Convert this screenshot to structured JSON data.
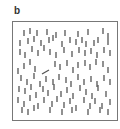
{
  "panel": {
    "label": "b",
    "description": "Visual search stimulus: array of vertical line distractors with a single oblique target",
    "frame_color": "#777777",
    "line_color": "#555555"
  },
  "stimulus": {
    "distractor_orientation": "vertical",
    "target_orientation": "oblique",
    "target": {
      "x1": 42,
      "y1": 74,
      "x2": 49,
      "y2": 70
    },
    "distractors": [
      [
        24,
        33
      ],
      [
        30,
        31
      ],
      [
        37,
        33
      ],
      [
        47,
        32
      ],
      [
        56,
        35
      ],
      [
        65,
        33
      ],
      [
        78,
        34
      ],
      [
        88,
        32
      ],
      [
        103,
        31
      ],
      [
        108,
        36
      ],
      [
        20,
        43
      ],
      [
        28,
        41
      ],
      [
        34,
        39
      ],
      [
        41,
        43
      ],
      [
        49,
        40
      ],
      [
        53,
        38
      ],
      [
        62,
        44
      ],
      [
        70,
        40
      ],
      [
        76,
        42
      ],
      [
        82,
        40
      ],
      [
        86,
        44
      ],
      [
        94,
        43
      ],
      [
        98,
        40
      ],
      [
        108,
        42
      ],
      [
        20,
        52
      ],
      [
        25,
        55
      ],
      [
        32,
        49
      ],
      [
        38,
        53
      ],
      [
        44,
        48
      ],
      [
        50,
        52
      ],
      [
        56,
        55
      ],
      [
        64,
        50
      ],
      [
        72,
        54
      ],
      [
        79,
        50
      ],
      [
        85,
        53
      ],
      [
        91,
        51
      ],
      [
        97,
        55
      ],
      [
        104,
        50
      ],
      [
        110,
        53
      ],
      [
        18,
        71
      ],
      [
        24,
        66
      ],
      [
        30,
        62
      ],
      [
        35,
        69
      ],
      [
        55,
        64
      ],
      [
        60,
        67
      ],
      [
        67,
        63
      ],
      [
        73,
        70
      ],
      [
        78,
        65
      ],
      [
        85,
        63
      ],
      [
        90,
        67
      ],
      [
        96,
        62
      ],
      [
        103,
        64
      ],
      [
        108,
        70
      ],
      [
        21,
        78
      ],
      [
        27,
        82
      ],
      [
        34,
        76
      ],
      [
        40,
        84
      ],
      [
        46,
        79
      ],
      [
        53,
        82
      ],
      [
        59,
        77
      ],
      [
        66,
        80
      ],
      [
        71,
        84
      ],
      [
        78,
        77
      ],
      [
        84,
        82
      ],
      [
        91,
        79
      ],
      [
        97,
        84
      ],
      [
        104,
        78
      ],
      [
        110,
        82
      ],
      [
        19,
        89
      ],
      [
        25,
        91
      ],
      [
        31,
        87
      ],
      [
        36,
        95
      ],
      [
        43,
        89
      ],
      [
        48,
        93
      ],
      [
        54,
        87
      ],
      [
        61,
        94
      ],
      [
        67,
        90
      ],
      [
        73,
        96
      ],
      [
        80,
        88
      ],
      [
        86,
        92
      ],
      [
        92,
        96
      ],
      [
        98,
        88
      ],
      [
        106,
        94
      ],
      [
        18,
        100
      ],
      [
        24,
        104
      ],
      [
        30,
        98
      ],
      [
        38,
        106
      ],
      [
        44,
        100
      ],
      [
        52,
        104
      ],
      [
        57,
        99
      ],
      [
        64,
        105
      ],
      [
        70,
        101
      ],
      [
        76,
        108
      ],
      [
        84,
        100
      ],
      [
        90,
        106
      ],
      [
        95,
        101
      ],
      [
        102,
        106
      ],
      [
        110,
        102
      ],
      [
        22,
        110
      ],
      [
        28,
        112
      ],
      [
        34,
        108
      ],
      [
        50,
        110
      ],
      [
        62,
        112
      ],
      [
        72,
        110
      ],
      [
        88,
        112
      ],
      [
        100,
        110
      ],
      [
        108,
        112
      ]
    ]
  }
}
